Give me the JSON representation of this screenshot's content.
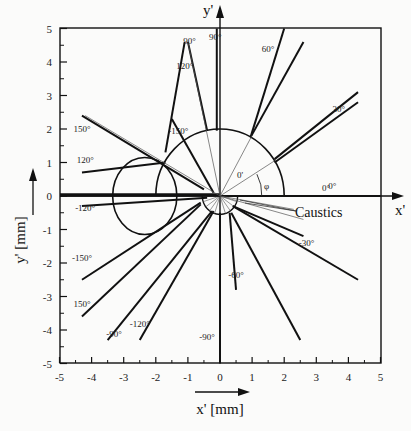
{
  "chart_data": {
    "type": "line",
    "title": "",
    "xlabel": "x' [mm]",
    "ylabel": "y' [mm]",
    "xlim": [
      -5,
      5
    ],
    "ylim": [
      -5,
      5
    ],
    "x_ticks": [
      "-5",
      "-4",
      "-3",
      "-2",
      "-1",
      "0",
      "1",
      "2",
      "3",
      "4",
      "5"
    ],
    "y_ticks": [
      "5",
      "4",
      "3",
      "2",
      "1",
      "0",
      "-1",
      "-2",
      "-3",
      "-4",
      "-5"
    ],
    "axis_arrow_labels": {
      "x": "x'",
      "y": "y'"
    },
    "grid": false,
    "annotations": {
      "caustics": "Caustics",
      "phi": "φ",
      "zero_prime": "0'",
      "zero_deg": "0°"
    },
    "ray_labels": [
      {
        "label": "90°",
        "x": -0.95,
        "y": 4.55
      },
      {
        "label": "120°",
        "x": -1.1,
        "y": 3.8
      },
      {
        "label": "90°",
        "x": -0.15,
        "y": 4.65
      },
      {
        "label": "60°",
        "x": 1.5,
        "y": 4.3
      },
      {
        "label": "30°",
        "x": 3.7,
        "y": 2.5
      },
      {
        "label": "150°",
        "x": -4.3,
        "y": 1.9
      },
      {
        "label": "-150°",
        "x": -1.3,
        "y": 1.85
      },
      {
        "label": "120°",
        "x": -4.2,
        "y": 1.0
      },
      {
        "label": "0°",
        "x": 3.5,
        "y": 0.2
      },
      {
        "label": "-120°",
        "x": -4.2,
        "y": -0.45
      },
      {
        "label": "-150°",
        "x": -4.3,
        "y": -1.95
      },
      {
        "label": "150°",
        "x": -4.3,
        "y": -3.3
      },
      {
        "label": "-90°",
        "x": -3.3,
        "y": -4.2
      },
      {
        "label": "-120°",
        "x": -2.5,
        "y": -3.9
      },
      {
        "label": "-90°",
        "x": -0.4,
        "y": -4.3
      },
      {
        "label": "-60°",
        "x": 0.5,
        "y": -2.45
      },
      {
        "label": "-30°",
        "x": 2.7,
        "y": -1.5
      }
    ],
    "series": [
      {
        "name": "caustic circle (upper)",
        "shape": "semicircle",
        "center": [
          0,
          0
        ],
        "radius": 2.0
      },
      {
        "name": "caustic circle (left)",
        "shape": "circle",
        "center": [
          -2.5,
          0.0
        ],
        "radius": 1.3
      },
      {
        "name": "small caustic",
        "shape": "semicircle",
        "center": [
          0,
          0
        ],
        "radius": 0.55
      },
      {
        "name": "ray 0°",
        "points": [
          [
            0,
            0
          ],
          [
            5,
            0
          ]
        ]
      },
      {
        "name": "ray 30°",
        "points": [
          [
            1.7,
            1.1
          ],
          [
            4.3,
            3.1
          ]
        ]
      },
      {
        "name": "ray 30° b",
        "points": [
          [
            1.7,
            1.0
          ],
          [
            4.3,
            2.8
          ]
        ]
      },
      {
        "name": "ray 60°",
        "points": [
          [
            0.95,
            1.75
          ],
          [
            2.0,
            5.0
          ]
        ]
      },
      {
        "name": "ray 60° b",
        "points": [
          [
            0.95,
            1.75
          ],
          [
            2.6,
            4.6
          ]
        ]
      },
      {
        "name": "ray 90°",
        "points": [
          [
            -0.1,
            1.95
          ],
          [
            -0.1,
            5.0
          ]
        ]
      },
      {
        "name": "ray -30°",
        "points": [
          [
            0.4,
            -0.3
          ],
          [
            4.3,
            -2.5
          ]
        ]
      },
      {
        "name": "ray -30° b",
        "points": [
          [
            0.4,
            -0.3
          ],
          [
            2.6,
            -1.2
          ]
        ]
      },
      {
        "name": "ray -60°",
        "points": [
          [
            0.3,
            -0.5
          ],
          [
            0.5,
            -2.8
          ]
        ]
      },
      {
        "name": "ray -60° b",
        "points": [
          [
            0.35,
            -0.5
          ],
          [
            2.5,
            -4.3
          ]
        ]
      },
      {
        "name": "ray -90°",
        "points": [
          [
            0.0,
            -0.5
          ],
          [
            0.0,
            -5.0
          ]
        ]
      },
      {
        "name": "ray -90° left",
        "points": [
          [
            -0.25,
            -0.45
          ],
          [
            -3.5,
            -4.3
          ]
        ]
      },
      {
        "name": "ray -120°",
        "points": [
          [
            -0.2,
            -0.45
          ],
          [
            -2.5,
            -4.3
          ]
        ]
      },
      {
        "name": "ray 150° lower",
        "points": [
          [
            -0.6,
            -0.25
          ],
          [
            -4.3,
            -3.6
          ]
        ]
      },
      {
        "name": "ray -150°",
        "points": [
          [
            -0.6,
            -0.2
          ],
          [
            -4.3,
            -2.5
          ]
        ]
      },
      {
        "name": "ray -120° horiz",
        "points": [
          [
            -0.4,
            -0.05
          ],
          [
            -4.3,
            -0.3
          ]
        ]
      },
      {
        "name": "ray 120° horiz",
        "points": [
          [
            -1.7,
            1.0
          ],
          [
            -4.3,
            0.7
          ]
        ]
      },
      {
        "name": "ray 150°",
        "points": [
          [
            -0.5,
            0.2
          ],
          [
            -4.3,
            2.4
          ]
        ]
      },
      {
        "name": "ray -150° upper",
        "points": [
          [
            -0.2,
            0.1
          ],
          [
            -1.5,
            2.3
          ]
        ]
      },
      {
        "name": "ray 120° upper",
        "points": [
          [
            -1.7,
            1.3
          ],
          [
            -1.1,
            4.6
          ]
        ]
      },
      {
        "name": "ray 90° upper cusp",
        "points": [
          [
            -0.4,
            1.95
          ],
          [
            -1.0,
            4.6
          ]
        ]
      }
    ]
  }
}
